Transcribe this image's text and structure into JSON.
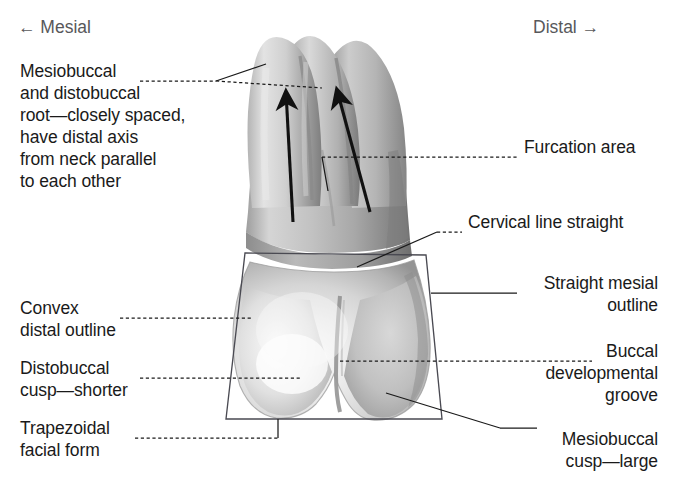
{
  "figure": {
    "background_color": "#ffffff",
    "text_color": "#1a1a1a",
    "direction_text_color": "#58585a"
  },
  "orientation": {
    "mesial": "← Mesial",
    "distal": "Distal →"
  },
  "labels": {
    "roots": "Mesiobuccal\nand distobuccal\nroot—closely spaced,\nhave distal axis\nfrom neck parallel\nto each other",
    "convex_distal": "Convex\ndistal outline",
    "distobuccal_cusp": "Distobuccal\ncusp—shorter",
    "trapezoidal": "Trapezoidal\nfacial form",
    "furcation": "Furcation area",
    "cervical_line": "Cervical line straight",
    "straight_mesial": "Straight mesial\noutline",
    "buccal_groove": "Buccal\ndevelopmental\ngroove",
    "mesiobuccal_cusp": "Mesiobuccal\ncusp—large"
  },
  "colors": {
    "leader_line": "#1a1a1a",
    "outline_box": "#3a3a44",
    "arrow": "#111111",
    "tooth_light": "#f2f2f2",
    "tooth_mid": "#c9c9c9",
    "tooth_dark": "#8e8e8e",
    "tooth_shadow": "#6f6f6f"
  }
}
